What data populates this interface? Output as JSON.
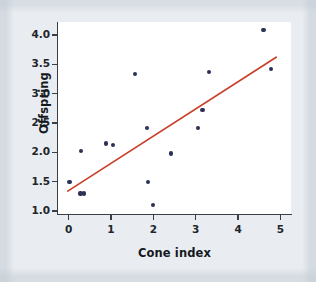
{
  "chart_data": {
    "type": "scatter",
    "title": "",
    "xlabel": "Cone index",
    "ylabel": "Offspring",
    "xlim": [
      -0.25,
      5.25
    ],
    "ylim": [
      0.95,
      4.22
    ],
    "xticks": [
      0,
      1,
      2,
      3,
      4,
      5
    ],
    "xtick_labels": [
      "0",
      "1",
      "2",
      "3",
      "4",
      "5"
    ],
    "yticks": [
      1.0,
      1.5,
      2.0,
      2.5,
      3.0,
      3.5,
      4.0
    ],
    "ytick_labels": [
      "1.0",
      "1.5",
      "2.0",
      "2.5",
      "3.0",
      "3.5",
      "4.0"
    ],
    "grid": false,
    "legend": null,
    "point_color": "#2b3156",
    "line_color": "#c8402a",
    "panel_color": "#ffffff",
    "background_color": "#e9edf1",
    "points": [
      {
        "x": 0.02,
        "y": 1.5
      },
      {
        "x": 0.28,
        "y": 1.3
      },
      {
        "x": 0.36,
        "y": 1.3
      },
      {
        "x": 0.3,
        "y": 2.02
      },
      {
        "x": 0.88,
        "y": 2.15
      },
      {
        "x": 1.05,
        "y": 2.12
      },
      {
        "x": 1.57,
        "y": 3.34
      },
      {
        "x": 1.85,
        "y": 2.42
      },
      {
        "x": 1.88,
        "y": 1.49
      },
      {
        "x": 2.0,
        "y": 1.11
      },
      {
        "x": 2.42,
        "y": 1.98
      },
      {
        "x": 3.05,
        "y": 2.42
      },
      {
        "x": 3.16,
        "y": 2.72
      },
      {
        "x": 3.32,
        "y": 3.37
      },
      {
        "x": 4.6,
        "y": 4.08
      },
      {
        "x": 4.78,
        "y": 3.42
      }
    ],
    "fit_line": {
      "name": "least-squares regression line",
      "x_start": -0.02,
      "y_start": 1.34,
      "x_end": 4.9,
      "y_end": 3.62
    }
  }
}
